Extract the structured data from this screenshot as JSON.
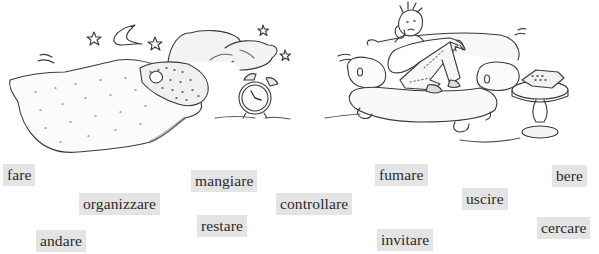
{
  "illustrations": [
    {
      "name": "sleeping-in-bed",
      "description": "person asleep under a quilt with pillows, moon, stars and an alarm clock"
    },
    {
      "name": "man-on-sofa",
      "description": "bored man slouched on a sofa next to a side table with a telephone"
    }
  ],
  "words": [
    {
      "label": "fare",
      "x": 3,
      "y": 164,
      "w": 32
    },
    {
      "label": "organizzare",
      "x": 79,
      "y": 193,
      "w": 80
    },
    {
      "label": "andare",
      "x": 36,
      "y": 230,
      "w": 48
    },
    {
      "label": "mangiare",
      "x": 191,
      "y": 170,
      "w": 68
    },
    {
      "label": "restare",
      "x": 197,
      "y": 215,
      "w": 49
    },
    {
      "label": "controllare",
      "x": 276,
      "y": 193,
      "w": 78
    },
    {
      "label": "fumare",
      "x": 375,
      "y": 164,
      "w": 54
    },
    {
      "label": "invitare",
      "x": 377,
      "y": 229,
      "w": 58
    },
    {
      "label": "uscire",
      "x": 462,
      "y": 188,
      "w": 47
    },
    {
      "label": "bere",
      "x": 552,
      "y": 165,
      "w": 36
    },
    {
      "label": "cercare",
      "x": 537,
      "y": 217,
      "w": 56
    }
  ],
  "colors": {
    "word_box": "#e4e4e4",
    "word_text": "#2a2a2a",
    "ink": "#3a3a3a"
  }
}
